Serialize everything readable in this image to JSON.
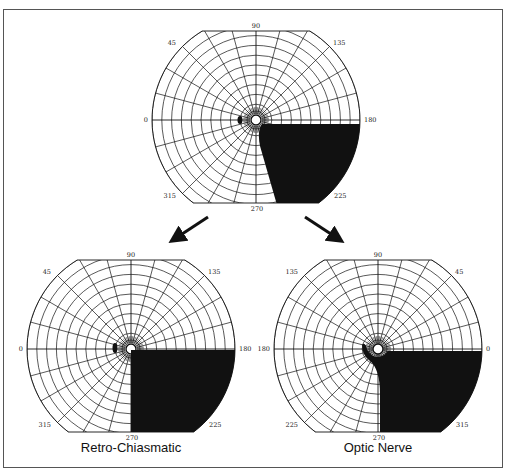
{
  "figure": {
    "border_color": "#555555",
    "ink_color": "#111111",
    "background": "#ffffff"
  },
  "charts": [
    {
      "id": "top",
      "name": "source-field",
      "caption": "",
      "center": [
        256,
        120
      ],
      "radius": 104,
      "clip_top": 31,
      "clip_bottom": 203,
      "angle_labels": {
        "top": "90",
        "upper_left": "45",
        "upper_right": "135",
        "left": "0",
        "right": "180",
        "lower_left": "315",
        "lower_right": "225",
        "bottom": "270"
      },
      "defect": "top"
    },
    {
      "id": "left",
      "name": "retro-chiasmatic-field",
      "caption": "Retro-Chiasmatic",
      "center": [
        131,
        349
      ],
      "radius": 104,
      "clip_top": 260,
      "clip_bottom": 432,
      "angle_labels": {
        "top": "90",
        "upper_left": "45",
        "upper_right": "135",
        "left": "0",
        "right": "180",
        "lower_left": "315",
        "lower_right": "225",
        "bottom": "270"
      },
      "defect": "quadrant"
    },
    {
      "id": "right",
      "name": "optic-nerve-field",
      "caption": "Optic Nerve",
      "center": [
        378,
        349
      ],
      "radius": 104,
      "clip_top": 260,
      "clip_bottom": 432,
      "angle_labels": {
        "top": "90",
        "upper_left": "135",
        "upper_right": "45",
        "left": "180",
        "right": "0",
        "lower_left": "225",
        "lower_right": "315",
        "bottom": "270"
      },
      "defect": "optic"
    }
  ],
  "arrows": [
    {
      "name": "arrow-to-retro-chiasmatic",
      "from": [
        208,
        217
      ],
      "to": [
        176,
        238
      ]
    },
    {
      "name": "arrow-to-optic-nerve",
      "from": [
        305,
        217
      ],
      "to": [
        337,
        238
      ]
    }
  ]
}
